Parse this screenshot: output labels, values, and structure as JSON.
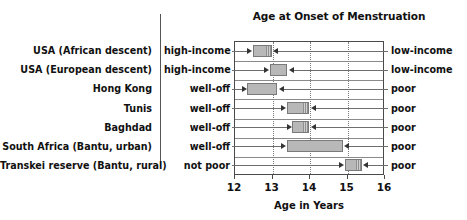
{
  "chart_data": {
    "type": "bar",
    "orientation": "horizontal",
    "title": "Age at Onset of Menstruation",
    "xlabel": "Age in Years",
    "ylabel": "",
    "xlim": [
      12,
      16
    ],
    "xticks": [
      12,
      13,
      14,
      15,
      16
    ],
    "xtick_labels": [
      "12",
      "13",
      "14",
      "15",
      "16"
    ],
    "grid": "vertical dotted at 13, 14, 15",
    "legend": "none",
    "categories": [
      "USA (African descent)",
      "USA (European descent)",
      "Hong Kong",
      "Tunis",
      "Baghdad",
      "South Africa (Bantu, urban)",
      "Transkei reserve (Bantu, rural)"
    ],
    "left_group_labels": [
      "high-income",
      "high-income",
      "well-off",
      "well-off",
      "well-off",
      "well-off",
      "not poor"
    ],
    "right_group_labels": [
      "low-income",
      "low-income",
      "poor",
      "poor",
      "poor",
      "poor",
      "poor"
    ],
    "ranges": [
      {
        "group": "USA (African descent)",
        "start": 12.5,
        "end": 13.0
      },
      {
        "group": "USA (European descent)",
        "start": 12.95,
        "end": 13.42
      },
      {
        "group": "Hong Kong",
        "start": 12.35,
        "end": 13.15
      },
      {
        "group": "Tunis",
        "start": 13.4,
        "end": 14.0
      },
      {
        "group": "Baghdad",
        "start": 13.55,
        "end": 14.0
      },
      {
        "group": "South Africa (Bantu, urban)",
        "start": 13.4,
        "end": 14.9
      },
      {
        "group": "Transkei reserve (Bantu, rural)",
        "start": 14.95,
        "end": 15.4
      }
    ]
  },
  "rows": [
    {
      "name": "USA (African descent)",
      "left": "high-income",
      "right": "low-income",
      "start": 12.5,
      "end": 13.0,
      "hatched": true
    },
    {
      "name": "USA (European descent)",
      "left": "high-income",
      "right": "low-income",
      "start": 12.95,
      "end": 13.42,
      "hatched": false
    },
    {
      "name": "Hong Kong",
      "left": "well-off",
      "right": "poor",
      "start": 12.35,
      "end": 13.15,
      "hatched": false
    },
    {
      "name": "Tunis",
      "left": "well-off",
      "right": "poor",
      "start": 13.4,
      "end": 14.0,
      "hatched": true
    },
    {
      "name": "Baghdad",
      "left": "well-off",
      "right": "poor",
      "start": 13.55,
      "end": 14.0,
      "hatched": true
    },
    {
      "name": "South Africa (Bantu, urban)",
      "left": "well-off",
      "right": "poor",
      "start": 13.4,
      "end": 14.9,
      "hatched": false
    },
    {
      "name": "Transkei reserve (Bantu, rural)",
      "left": "not poor",
      "right": "poor",
      "start": 14.95,
      "end": 15.4,
      "hatched": true
    }
  ],
  "axis": {
    "title": "Age in Years",
    "ticks": [
      "12",
      "13",
      "14",
      "15",
      "16"
    ]
  },
  "colors": {
    "bar_fill": "#b8b8b8",
    "bar_border": "#7a7a7a",
    "axis": "#4a4a4a",
    "grid": "#7d7d7d",
    "text": "#111111",
    "background": "#ffffff"
  }
}
